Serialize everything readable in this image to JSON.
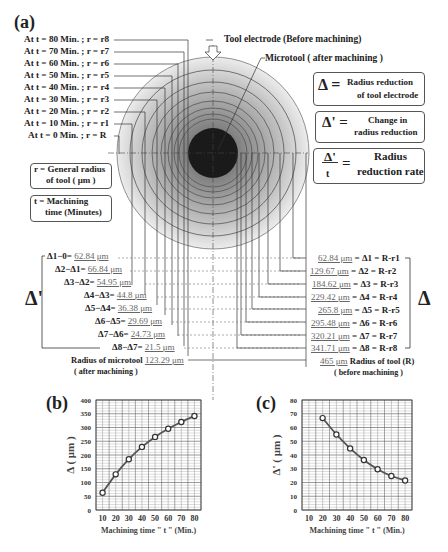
{
  "panel_a": {
    "label": "(a)",
    "time_labels": [
      "At  t = 80 Min. ; r = r8",
      "At  t = 70 Min. ; r = r7",
      "At  t = 60 Min. ; r = r6",
      "At  t = 50 Min. ; r = r5",
      "At  t = 40 Min. ; r = r4",
      "At  t = 30 Min. ; r = r3",
      "At  t = 20 Min. ; r = r2",
      "At  t = 10 Min. ; r = r1",
      "At   t = 0 Min. ; r = R"
    ],
    "tool_electrode_label": "Tool electrode (Before machining)",
    "microtool_label": "Microtool ( after machining )",
    "legend": {
      "delta_symbol": "Δ =",
      "delta_text_1": "Radius reduction",
      "delta_text_2": "of tool electrode",
      "delta_prime_symbol": "Δ' =",
      "delta_prime_text_1": "Change in",
      "delta_prime_text_2": "radius reduction",
      "rate_num": "Δ'",
      "rate_den": "t",
      "rate_eq": "=",
      "rate_text_1": "Radius",
      "rate_text_2": "reduction rate",
      "r_def_1": "r = General radius",
      "r_def_2": "of tool ( μm )",
      "t_def_1": "t = Machining",
      "t_def_2": "time (Minutes)"
    },
    "delta_prime_bracket_label": "Δ'",
    "delta_bracket_label": "Δ",
    "delta_prime_rows": [
      {
        "expr": "Δ1−0=",
        "value": "62.84 μm"
      },
      {
        "expr": "Δ2−Δ1=",
        "value": "66.84 μm"
      },
      {
        "expr": "Δ3−Δ2=",
        "value": "54.95 μm"
      },
      {
        "expr": "Δ4−Δ3=",
        "value": "44.8 μm"
      },
      {
        "expr": "Δ5−Δ4=",
        "value": "36.38 μm"
      },
      {
        "expr": "Δ6−Δ5=",
        "value": "29.69 μm"
      },
      {
        "expr": "Δ7−Δ6=",
        "value": "24.73 μm"
      },
      {
        "expr": "Δ8−Δ7=",
        "value": "21.5 μm"
      }
    ],
    "delta_rows": [
      {
        "value": "62.84 μm",
        "expr": "= Δ1 = R-r1"
      },
      {
        "value": "129.67 μm",
        "expr": "= Δ2 = R-r2"
      },
      {
        "value": "184.62 μm",
        "expr": "= Δ3 = R-r3"
      },
      {
        "value": "229.42 μm",
        "expr": "= Δ4 = R-r4"
      },
      {
        "value": "265.8 μm",
        "expr": "= Δ5 = R-r5"
      },
      {
        "value": "295.48 μm",
        "expr": "= Δ6 = R-r6"
      },
      {
        "value": "320.21 μm",
        "expr": "= Δ7 = R-r7"
      },
      {
        "value": "341.71 μm",
        "expr": "= Δ8 = R-r8"
      }
    ],
    "microtool_radius": {
      "label": "Radius of microtool",
      "value": "123.29 μm",
      "note": "( after machining )"
    },
    "tool_radius": {
      "value": "465 μm",
      "label": "Radius of  tool (R)",
      "note": "( before machining )"
    }
  },
  "chart_data": [
    {
      "panel": "(b)",
      "type": "line",
      "title": "",
      "xlabel": "Machining time \" t \" (Min.)",
      "ylabel": "Δ ( μm )",
      "x": [
        10,
        20,
        30,
        40,
        50,
        60,
        70,
        80
      ],
      "series": [
        {
          "name": "Δ",
          "values": [
            62.84,
            129.67,
            184.62,
            229.42,
            265.8,
            295.48,
            320.21,
            341.71
          ]
        }
      ],
      "xticks": [
        "10",
        "20",
        "30",
        "40",
        "50",
        "60",
        "70",
        "80"
      ],
      "yticks": [
        "0",
        "50",
        "100",
        "150",
        "200",
        "250",
        "300",
        "350",
        "400"
      ],
      "ylim": [
        0,
        400
      ],
      "grid": true,
      "marker": "circle"
    },
    {
      "panel": "(c)",
      "type": "line",
      "title": "",
      "xlabel": "Machining time \" t \" (Min.)",
      "ylabel": "Δ' ( μm )",
      "x": [
        20,
        30,
        40,
        50,
        60,
        70,
        80
      ],
      "series": [
        {
          "name": "Δ'",
          "values": [
            66.84,
            54.95,
            44.8,
            36.38,
            29.69,
            24.73,
            21.5
          ]
        }
      ],
      "xticks": [
        "10",
        "20",
        "30",
        "40",
        "50",
        "60",
        "70",
        "80"
      ],
      "yticks": [
        "0",
        "10",
        "20",
        "30",
        "40",
        "50",
        "60",
        "70",
        "80"
      ],
      "ylim": [
        0,
        80
      ],
      "grid": true,
      "marker": "circle"
    }
  ],
  "panel_b": {
    "label": "(b)"
  },
  "panel_c": {
    "label": "(c)"
  }
}
